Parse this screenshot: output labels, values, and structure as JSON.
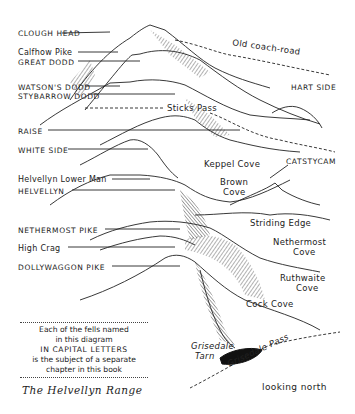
{
  "title": "The Helvellyn Range",
  "orientation": "looking north",
  "fell_labels": [
    {
      "text": "CLOUGH HEAD",
      "caps": true
    },
    {
      "text": "Calfhow Pike",
      "caps": false
    },
    {
      "text": "GREAT DODD",
      "caps": true
    },
    {
      "text": "WATSON'S DODD",
      "caps": true
    },
    {
      "text": "STYBARROW DODD",
      "caps": true
    },
    {
      "text": "RAISE",
      "caps": true
    },
    {
      "text": "WHITE SIDE",
      "caps": true
    },
    {
      "text": "Helvellyn Lower Man",
      "caps": false
    },
    {
      "text": "HELVELLYN",
      "caps": true
    },
    {
      "text": "NETHERMOST PIKE",
      "caps": true
    },
    {
      "text": "High Crag",
      "caps": false
    },
    {
      "text": "DOLLYWAGGON PIKE",
      "caps": true
    },
    {
      "text": "HART SIDE",
      "caps": true
    },
    {
      "text": "CATSTYCAM",
      "caps": true
    }
  ],
  "feature_labels": {
    "old_coach_road": "Old coach-road",
    "sticks_pass": "Sticks Pass",
    "keppel_cove": "Keppel Cove",
    "brown_cove_1": "Brown",
    "brown_cove_2": "Cove",
    "striding_edge": "Striding Edge",
    "nethermost_cove_1": "Nethermost",
    "nethermost_cove_2": "Cove",
    "ruthwaite_cove_1": "Ruthwaite",
    "ruthwaite_cove_2": "Cove",
    "cock_cove": "Cock Cove",
    "grisedale_tarn_1": "Grisedale",
    "grisedale_tarn_2": "Tarn",
    "grisedale_pass": "Grisedale Pass"
  },
  "note": {
    "line1": "Each of the fells named",
    "line2": "in this diagram",
    "line3": "IN CAPITAL LETTERS",
    "line4": "is the subject of a separate",
    "line5": "chapter in this book"
  },
  "colors": {
    "ink": "#1a1a1a",
    "paper": "#ffffff"
  }
}
